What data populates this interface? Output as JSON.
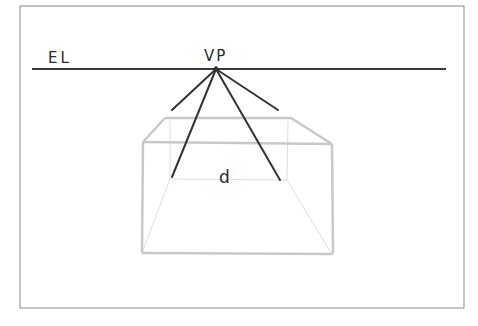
{
  "diagram": {
    "type": "one-point-perspective-sketch",
    "labels": {
      "eye_level": "EL",
      "vanishing_point": "VP",
      "box_label": "d"
    },
    "colors": {
      "background": "#ffffff",
      "frame": "#8a8a8a",
      "horizon": "#3a3a3a",
      "guidelines": "#333333",
      "box_strokes": "#c8c8c8",
      "box_hidden": "#dedede"
    },
    "elements": [
      {
        "id": "frame",
        "desc": "thin rectangular border"
      },
      {
        "id": "eye-level-line",
        "desc": "horizontal horizon line labeled EL"
      },
      {
        "id": "vanishing-point",
        "desc": "point on horizon labeled VP"
      },
      {
        "id": "converging-lines",
        "count": 4,
        "desc": "dark lines radiating from VP"
      },
      {
        "id": "box",
        "desc": "light-grey transparent box drawn in one-point perspective, inner rear edge labeled d"
      }
    ]
  }
}
